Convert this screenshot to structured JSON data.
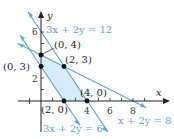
{
  "diagram": {
    "type": "linear-programming-feasible-region",
    "axes": {
      "x_label": "x",
      "y_label": "y",
      "x_ticks": [
        "4",
        "6",
        "8"
      ],
      "y_ticks": [
        "2",
        "6"
      ]
    },
    "lines": [
      {
        "equation": "3x + 2y = 12",
        "color": "#5aa8d6"
      },
      {
        "equation": "3x + 2y = 6",
        "color": "#5aa8d6"
      },
      {
        "equation": "x + 2y = 8",
        "color": "#5aa8d6"
      }
    ],
    "vertices": [
      {
        "label": "(0, 4)",
        "x": 0,
        "y": 4
      },
      {
        "label": "(2, 3)",
        "x": 2,
        "y": 3
      },
      {
        "label": "(0, 3)",
        "x": 0,
        "y": 3
      },
      {
        "label": "(2, 0)",
        "x": 2,
        "y": 0
      },
      {
        "label": "(4, 0)",
        "x": 4,
        "y": 0
      }
    ],
    "colors": {
      "region_fill": "#d6ecf8",
      "line": "#5aa8d6",
      "axis": "#222222",
      "point": "#111111"
    }
  }
}
